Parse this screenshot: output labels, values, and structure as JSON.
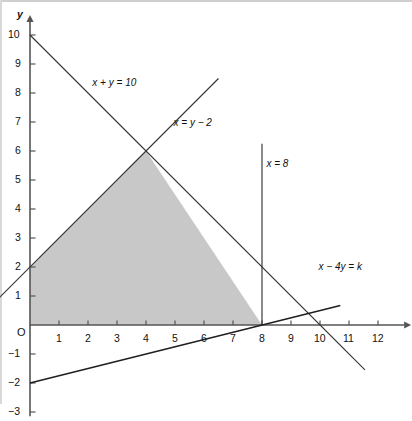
{
  "figure": {
    "width": 412,
    "height": 421,
    "background_color": "#ffffff",
    "border_color": "#cfcfcf"
  },
  "axes": {
    "x_axis_name": "x",
    "y_axis_name": "y",
    "origin_label": "O",
    "axis_color": "#555555",
    "x_ticks": [
      "1",
      "2",
      "3",
      "4",
      "5",
      "6",
      "7",
      "8",
      "9",
      "10",
      "11",
      "12"
    ],
    "y_ticks": [
      "10",
      "9",
      "8",
      "7",
      "6",
      "5",
      "4",
      "3",
      "2",
      "1",
      "−1",
      "−2",
      "−3"
    ]
  },
  "annotations": {
    "line_sum": "x + y = 10",
    "line_xy2": "x = y − 2",
    "line_x8": "x = 8",
    "line_objective": "x − 4y = k"
  },
  "region": {
    "fill_color": "#c8c8c8",
    "edge_color": "#6e6e6e"
  },
  "chart_data": {
    "type": "line",
    "title": "",
    "xlabel": "x",
    "ylabel": "y",
    "xlim": [
      -2.2,
      13.2
    ],
    "ylim": [
      -3.2,
      10.6
    ],
    "grid": false,
    "legend": "none",
    "pixels_per_unit": 29,
    "origin_px": [
      30,
      325
    ],
    "series": [
      {
        "name": "x + y = 10",
        "equation": "x + y = 10",
        "label": "x + y = 10",
        "label_xy": [
          2.15,
          8.35
        ],
        "color": "#333333",
        "x": [
          0,
          11.55
        ],
        "y": [
          10,
          -1.55
        ]
      },
      {
        "name": "x = y - 2",
        "equation": "x = y − 2",
        "label": "x = y − 2",
        "label_xy": [
          4.95,
          6.95
        ],
        "color": "#333333",
        "x": [
          -2.05,
          6.5
        ],
        "y": [
          -0.05,
          8.5
        ]
      },
      {
        "name": "x = 8",
        "equation": "x = 8",
        "label": "x = 8",
        "label_xy": [
          8.05,
          5.55
        ],
        "color": "#333333",
        "x": [
          8,
          8
        ],
        "y": [
          0,
          6.25
        ]
      },
      {
        "name": "x - 4y = k",
        "equation": "x − 4y = k",
        "label": "x − 4y = k",
        "label_xy": [
          9.95,
          2.0
        ],
        "color": "#1f1f1f",
        "x": [
          0,
          10.7
        ],
        "y": [
          -2,
          0.675
        ]
      }
    ],
    "shaded_region": {
      "name": "feasible region",
      "vertices": [
        [
          0,
          0
        ],
        [
          0,
          2
        ],
        [
          4,
          6
        ],
        [
          8,
          0
        ]
      ],
      "fill": "#c8c8c8"
    },
    "key_points": [
      {
        "label": "apex",
        "x": 4,
        "y": 6
      },
      {
        "label": "y-intercept of x = y − 2",
        "x": 0,
        "y": 2
      },
      {
        "label": "x-intercept of x + y = 10",
        "x": 10,
        "y": 0
      },
      {
        "label": "y-intercept of x − 4y = k",
        "x": 0,
        "y": -2
      },
      {
        "label": "x-intercept of x − 4y = k",
        "x": 8,
        "y": 0
      }
    ]
  }
}
